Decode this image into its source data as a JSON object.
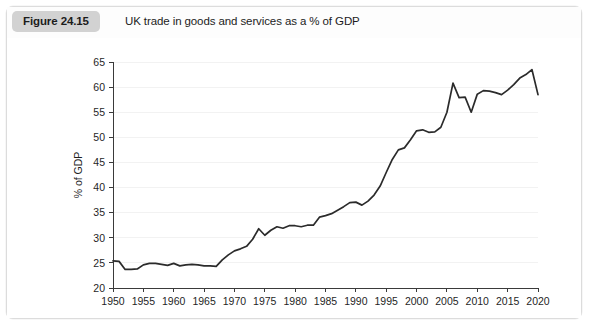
{
  "figure": {
    "badge_label": "Figure 24.15",
    "title": "UK trade in goods and services as a % of GDP"
  },
  "chart_data": {
    "type": "line",
    "title": "UK trade in goods and services as a % of GDP",
    "xlabel": "",
    "ylabel": "% of GDP",
    "xlim": [
      1950,
      2020
    ],
    "ylim": [
      20,
      65
    ],
    "xticks": [
      1950,
      1955,
      1960,
      1965,
      1970,
      1975,
      1980,
      1985,
      1990,
      1995,
      2000,
      2005,
      2010,
      2015,
      2020
    ],
    "yticks": [
      20,
      25,
      30,
      35,
      40,
      45,
      50,
      55,
      60,
      65
    ],
    "xtick_labels": [
      "1950",
      "1955",
      "1960",
      "1965",
      "1970",
      "1975",
      "1980",
      "1985",
      "1990",
      "1995",
      "2000",
      "2005",
      "2010",
      "2015",
      "2020"
    ],
    "ytick_labels": [
      "20",
      "25",
      "30",
      "35",
      "40",
      "45",
      "50",
      "55",
      "60",
      "65"
    ],
    "grid": true,
    "grid_axis": "y",
    "legend": false,
    "legend_position": "none",
    "line_color": "#2b2b2b",
    "series": [
      {
        "name": "UK trade in goods and services as a % of GDP",
        "x": [
          1950,
          1951,
          1952,
          1953,
          1954,
          1955,
          1956,
          1957,
          1958,
          1959,
          1960,
          1961,
          1962,
          1963,
          1964,
          1965,
          1966,
          1967,
          1968,
          1969,
          1970,
          1971,
          1972,
          1973,
          1974,
          1975,
          1976,
          1977,
          1978,
          1979,
          1980,
          1981,
          1982,
          1983,
          1984,
          1985,
          1986,
          1987,
          1988,
          1989,
          1990,
          1991,
          1992,
          1993,
          1994,
          1995,
          1996,
          1997,
          1998,
          1999,
          2000,
          2001,
          2002,
          2003,
          2004,
          2005,
          2006,
          2007,
          2008,
          2009,
          2010,
          2011,
          2012,
          2013,
          2014,
          2015,
          2016,
          2017,
          2018,
          2019,
          2020
        ],
        "values": [
          25.4,
          25.3,
          23.7,
          23.7,
          23.8,
          24.6,
          24.9,
          24.9,
          24.7,
          24.5,
          24.9,
          24.4,
          24.6,
          24.7,
          24.6,
          24.4,
          24.4,
          24.3,
          25.6,
          26.6,
          27.4,
          27.8,
          28.3,
          29.7,
          31.8,
          30.5,
          31.5,
          32.2,
          31.9,
          32.4,
          32.4,
          32.2,
          32.5,
          32.5,
          34.1,
          34.4,
          34.8,
          35.5,
          36.2,
          37.0,
          37.1,
          36.5,
          37.3,
          38.5,
          40.3,
          43.0,
          45.6,
          47.5,
          47.9,
          49.5,
          51.3,
          51.5,
          51.0,
          51.1,
          52.0,
          55.0,
          60.8,
          57.9,
          58.0,
          55.0,
          58.6,
          59.3,
          59.2,
          58.9,
          58.5,
          59.4,
          60.5,
          61.8,
          62.5,
          63.5,
          58.5
        ]
      }
    ],
    "notable_points": [
      {
        "year": 1950,
        "value": 25.4,
        "note": "series start"
      },
      {
        "year": 1953,
        "value": 23.7,
        "note": "early-1950s low"
      },
      {
        "year": 1967,
        "value": 24.3,
        "note": "end of flat post-war period"
      },
      {
        "year": 1974,
        "value": 31.8,
        "note": "oil-shock rise"
      },
      {
        "year": 2006,
        "value": 60.8,
        "note": "pre-crisis peak"
      },
      {
        "year": 2009,
        "value": 55.0,
        "note": "financial-crisis trough"
      },
      {
        "year": 2019,
        "value": 63.5,
        "note": "series peak"
      },
      {
        "year": 2020,
        "value": 58.5,
        "note": "pandemic drop"
      }
    ]
  }
}
